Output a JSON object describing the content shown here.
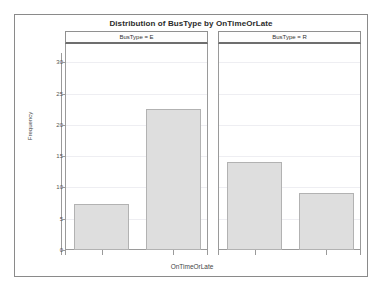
{
  "chart_data": {
    "type": "bar",
    "title": "Distribution of BusType by OnTimeOrLate",
    "xlabel": "OnTimeOrLate",
    "ylabel": "Frequency",
    "categories": [
      "L",
      "O"
    ],
    "ylim": [
      0,
      31.5
    ],
    "yticks": [
      0,
      5,
      10,
      15,
      20,
      25,
      30
    ],
    "ytick_labels": [
      "0",
      "5",
      "10",
      "15",
      "20",
      "25",
      "30"
    ],
    "grid": true,
    "legend": "none",
    "panel_variable": "BusType",
    "panels": [
      {
        "label": "BusType = E",
        "categories": [
          "L",
          "O"
        ],
        "values": [
          7.3,
          22.5
        ]
      },
      {
        "label": "BusType = R",
        "categories": [
          "L",
          "O"
        ],
        "values": [
          14.0,
          9.1
        ]
      }
    ],
    "colors": {
      "bar_fill": "#dedede",
      "bar_border": "#b2b2b2",
      "axis": "#9a9a9a",
      "gridline": "#eeeef2",
      "frame": "#8a8a8a",
      "text": "#3a3a3a"
    }
  }
}
